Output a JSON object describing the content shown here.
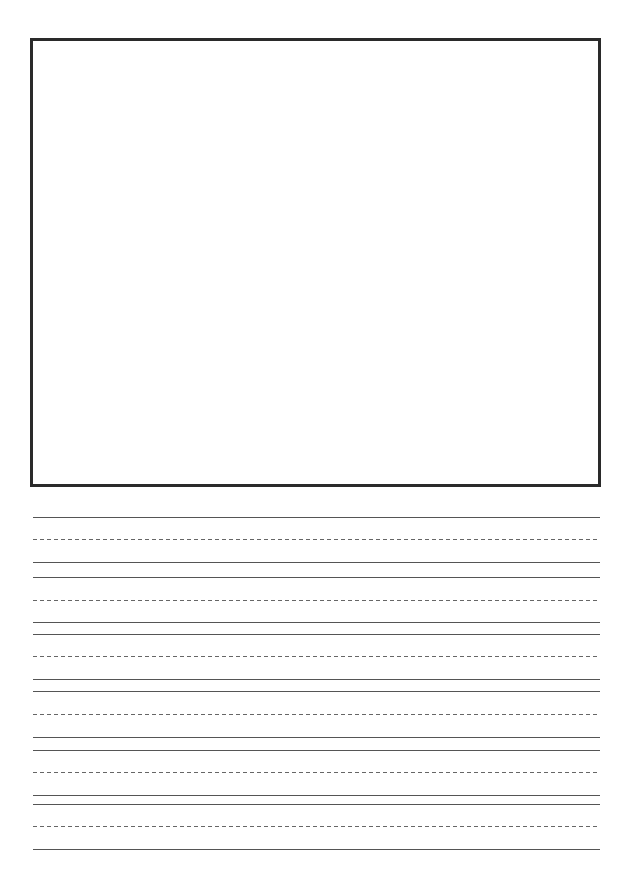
{
  "page": {
    "type": "handwriting-practice-sheet",
    "background_color": "#ffffff"
  },
  "drawing_box": {
    "border_color": "#2a2a2a",
    "content": ""
  },
  "writing_lines": {
    "line_color": "#555555",
    "dash_color": "#666666",
    "groups": [
      {
        "top": 517,
        "midline": 539,
        "baseline": 562
      },
      {
        "top": 577,
        "midline": 600,
        "baseline": 622
      },
      {
        "top": 634,
        "midline": 656,
        "baseline": 679
      },
      {
        "top": 691,
        "midline": 714,
        "baseline": 737
      },
      {
        "top": 750,
        "midline": 772,
        "baseline": 795
      },
      {
        "top": 804,
        "midline": 826,
        "baseline": 849
      }
    ]
  }
}
